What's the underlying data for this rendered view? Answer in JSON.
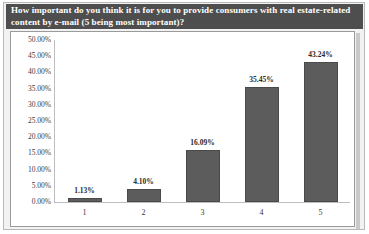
{
  "title": "How important do you think it is for you to provide consumers with real estate-related content by e-mail (5 being most important)?",
  "colors": {
    "title_bar_background": "#4e4e4e",
    "title_text": "#ffffff",
    "page_frame_background": "#f2f2f2",
    "panel_background": "#ffffff",
    "bar_fill": "#5c5c5c",
    "bar_border": "#4a4a4a",
    "axis_line": "#bdbdbd",
    "tick_text": "#3a3a3a"
  },
  "chart_data": {
    "type": "bar",
    "title": "How important do you think it is for you to provide consumers with real estate-related content by e-mail (5 being most important)?",
    "xlabel": "",
    "ylabel": "",
    "categories": [
      "1",
      "2",
      "3",
      "4",
      "5"
    ],
    "values": [
      1.13,
      4.1,
      16.09,
      35.45,
      43.24
    ],
    "data_labels": [
      "1.13%",
      "4.10%",
      "16.09%",
      "35.45%",
      "43.24%"
    ],
    "ylim": [
      0,
      50
    ],
    "ytick_values": [
      0,
      5,
      10,
      15,
      20,
      25,
      30,
      35,
      40,
      45,
      50
    ],
    "ytick_labels": [
      "0.00%",
      "5.00%",
      "10.00%",
      "15.00%",
      "20.00%",
      "25.00%",
      "30.00%",
      "35.00%",
      "40.00%",
      "45.00%",
      "50.00%"
    ],
    "grid": false,
    "legend": false,
    "legend_position": "none",
    "series": [
      {
        "name": "Percent of respondents",
        "values": [
          1.13,
          4.1,
          16.09,
          35.45,
          43.24
        ]
      }
    ]
  }
}
